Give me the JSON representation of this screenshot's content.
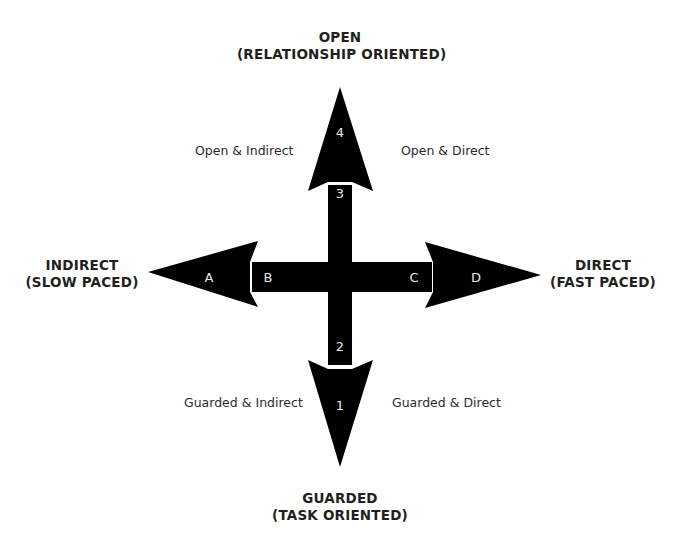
{
  "diagram": {
    "type": "quadrant-axes",
    "colors": {
      "arrow": "#000000",
      "text": "#231f20",
      "marker_text": "#e8e8e8",
      "background": "#ffffff"
    },
    "axes": {
      "top": {
        "line1": "OPEN",
        "line2": "(RELATIONSHIP ORIENTED)"
      },
      "bottom": {
        "line1": "GUARDED",
        "line2": "(TASK ORIENTED)"
      },
      "left": {
        "line1": "INDIRECT",
        "line2": "(SLOW PACED)"
      },
      "right": {
        "line1": "DIRECT",
        "line2": "(FAST PACED)"
      }
    },
    "quadrants": {
      "top_left": "Open & Indirect",
      "top_right": "Open & Direct",
      "bottom_left": "Guarded & Indirect",
      "bottom_right": "Guarded & Direct"
    },
    "markers": {
      "vertical": [
        "4",
        "3",
        "2",
        "1"
      ],
      "horizontal": [
        "A",
        "B",
        "C",
        "D"
      ]
    }
  }
}
